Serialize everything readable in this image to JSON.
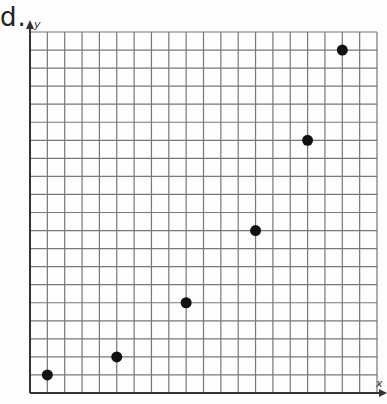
{
  "label": "d.",
  "chart_data": {
    "type": "scatter",
    "title": "",
    "xlabel": "x",
    "ylabel": "y",
    "xlim": [
      0,
      20
    ],
    "ylim": [
      0,
      20
    ],
    "grid": true,
    "x": [
      1,
      5,
      9,
      13,
      16,
      18
    ],
    "y": [
      1,
      2,
      5,
      9,
      14,
      19
    ],
    "tick_labels": false,
    "marker_color": "#111111"
  },
  "layout": {
    "origin_px": [
      30,
      393
    ],
    "cell_w": 17.35,
    "cell_h": 18.05,
    "cols": 20,
    "rows": 20
  }
}
